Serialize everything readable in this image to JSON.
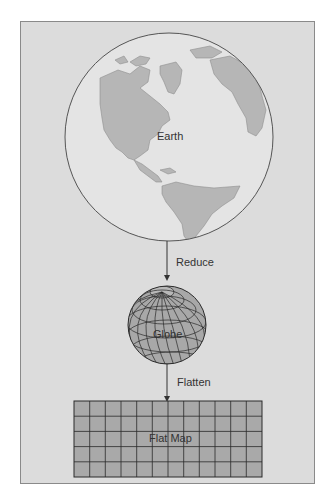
{
  "diagram": {
    "earth_label": "Earth",
    "reduce_label": "Reduce",
    "globe_label": "Globe",
    "flatten_label": "Flatten",
    "flat_map_label": "Flat Map",
    "flat_map_grid": {
      "columns": 12,
      "rows": 5
    },
    "colors": {
      "panel": "#dcdcdc",
      "ocean": "#e3e3e3",
      "land": "#b4b4b4",
      "globe": "#a8a8a8",
      "map": "#a9a9a9",
      "lines": "#2a2a2a"
    }
  }
}
